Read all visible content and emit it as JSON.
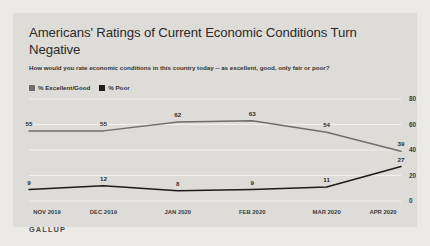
{
  "card": {
    "background_color": "#dedcd8",
    "page_background_color": "#eceae6"
  },
  "header": {
    "title": "Americans' Ratings of Current Economic Conditions Turn Negative",
    "subtitle": "How would you rate economic conditions in this country today -- as excellent, good, only fair or poor?"
  },
  "footer": {
    "brand": "GALLUP"
  },
  "legend": {
    "items": [
      {
        "label": "% Excellent/Good",
        "color": "#6e6e6e"
      },
      {
        "label": "% Poor",
        "color": "#1c1c1c"
      }
    ]
  },
  "chart_data": {
    "type": "line",
    "title": "Americans' Ratings of Current Economic Conditions Turn Negative",
    "subtitle": "How would you rate economic conditions in this country today -- as excellent, good, only fair or poor?",
    "xlabel": "",
    "ylabel": "",
    "categories": [
      "NOV 2019",
      "DEC 2019",
      "JAN 2020",
      "FEB 2020",
      "MAR 2020",
      "APR 2020"
    ],
    "series": [
      {
        "name": "% Excellent/Good",
        "color": "#6e6e6e",
        "values": [
          55,
          55,
          62,
          63,
          54,
          39
        ]
      },
      {
        "name": "% Poor",
        "color": "#1c1c1c",
        "values": [
          9,
          12,
          8,
          9,
          11,
          27
        ]
      }
    ],
    "ylim": [
      0,
      80
    ],
    "yticks": [
      0,
      20,
      40,
      60,
      80
    ],
    "ytick_labels": [
      "0",
      "20",
      "40",
      "60",
      "80"
    ],
    "grid": true,
    "grid_color": "#f2f1ee",
    "legend_position": "top-left",
    "data_labels": true
  }
}
